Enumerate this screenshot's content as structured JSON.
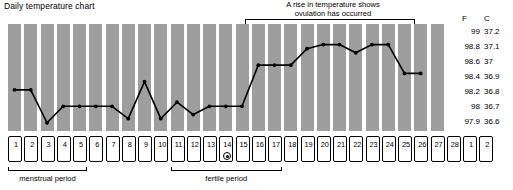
{
  "chart_title": "Daily temperature chart",
  "annotation": {
    "ovulation_note_line1": "A rise in temperature shows",
    "ovulation_note_line2": "ovulation has occurred",
    "bracket_start_day": 16,
    "bracket_end_day": 26
  },
  "scale": {
    "header_f": "F",
    "header_c": "C",
    "rows": [
      {
        "f": "99",
        "c": "37.2",
        "y": 31
      },
      {
        "f": "98.8",
        "c": "37.1",
        "y": 46
      },
      {
        "f": "98.6",
        "c": "37",
        "y": 61
      },
      {
        "f": "98.4",
        "c": "36.9",
        "y": 76
      },
      {
        "f": "98.2",
        "c": "36.8",
        "y": 91
      },
      {
        "f": "98",
        "c": "36.7",
        "y": 106
      },
      {
        "f": "97.9",
        "c": "36.6",
        "y": 121
      }
    ]
  },
  "days": [
    "1",
    "2",
    "3",
    "4",
    "5",
    "6",
    "7",
    "8",
    "9",
    "10",
    "11",
    "12",
    "13",
    "14",
    "15",
    "16",
    "17",
    "18",
    "19",
    "20",
    "21",
    "22",
    "23",
    "24",
    "25",
    "26",
    "27",
    "28",
    "1",
    "2"
  ],
  "ovulation_marker_day_index": 13,
  "brackets": [
    {
      "name": "menstrual period",
      "label": "menstrual period",
      "start_index": 0,
      "end_index": 4
    },
    {
      "name": "fertile period",
      "label": "fertile period",
      "start_index": 10,
      "end_index": 16
    }
  ],
  "colors": {
    "band": "#9e9e9e",
    "line": "#000000",
    "background": "#ffffff"
  },
  "chart_data": {
    "type": "line",
    "title": "Daily temperature chart",
    "xlabel": "",
    "ylabel": "Temperature",
    "grid": false,
    "legend": "none",
    "x": [
      1,
      2,
      3,
      4,
      5,
      6,
      7,
      8,
      9,
      10,
      11,
      12,
      13,
      14,
      15,
      16,
      17,
      18,
      19,
      20,
      21,
      22,
      23,
      24,
      25,
      26
    ],
    "y_axis_f": {
      "ticks": [
        97.9,
        98,
        98.2,
        98.4,
        98.6,
        98.8,
        99
      ],
      "range": [
        97.8,
        99.1
      ]
    },
    "y_axis_c": {
      "ticks": [
        36.6,
        36.7,
        36.8,
        36.9,
        37.0,
        37.1,
        37.2
      ],
      "range": [
        36.55,
        37.25
      ]
    },
    "series": [
      {
        "name": "Basal body temperature (F)",
        "values": [
          98.3,
          98.3,
          97.9,
          98.1,
          98.1,
          98.1,
          98.1,
          97.95,
          98.4,
          97.95,
          98.15,
          98.0,
          98.1,
          98.1,
          98.1,
          98.6,
          98.6,
          98.6,
          98.8,
          98.85,
          98.85,
          98.75,
          98.85,
          98.85,
          98.5,
          98.5
        ]
      }
    ],
    "annotations": [
      {
        "text": "A rise in temperature shows ovulation has occurred",
        "x_start": 16,
        "x_end": 26
      }
    ]
  }
}
